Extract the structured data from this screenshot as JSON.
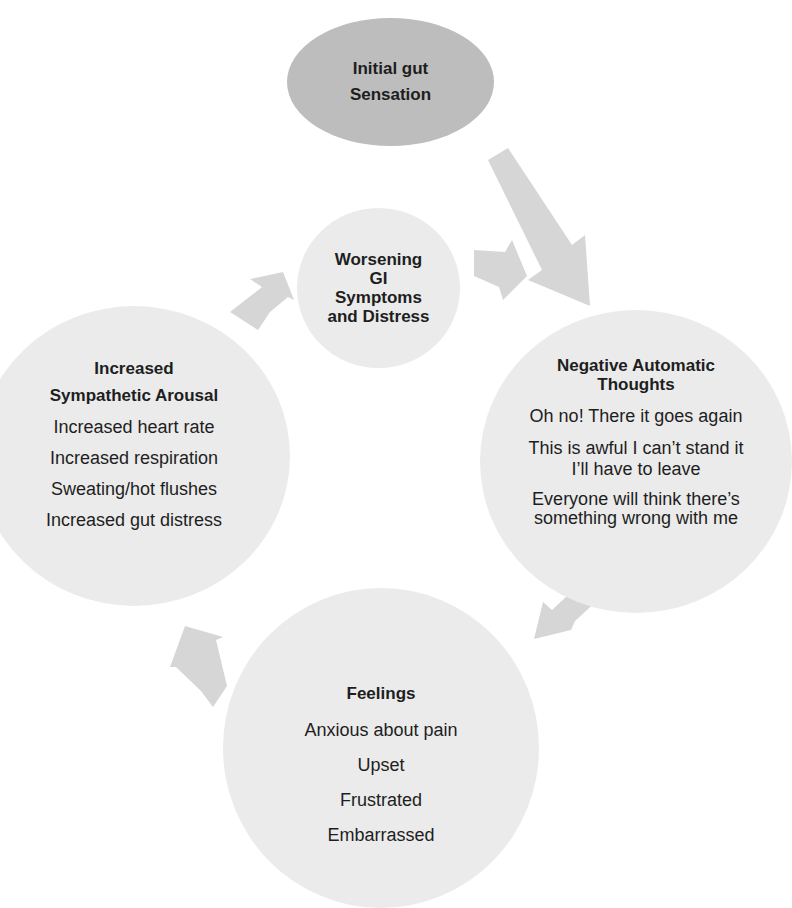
{
  "diagram": {
    "type": "cycle",
    "top_cut_text": "",
    "colors": {
      "start_node": "#bdbdbd",
      "cycle_node": "#ebebeb",
      "arrow": "#d4d4d4",
      "text": "#1e1e1e"
    },
    "start_node": {
      "title_line1": "Initial gut",
      "title_line2": "Sensation"
    },
    "center_node": {
      "lines": [
        "Worsening",
        "GI",
        "Symptoms",
        "and Distress"
      ]
    },
    "thoughts_node": {
      "title_line1": "Negative Automatic",
      "title_line2": "Thoughts",
      "items": [
        "Oh no! There it goes again",
        "This is awful I can’t stand it",
        "I’ll have to leave",
        "Everyone will think there’s",
        "something wrong with me"
      ]
    },
    "feelings_node": {
      "title": "Feelings",
      "items": [
        "Anxious about pain",
        "Upset",
        "Frustrated",
        "Embarrassed"
      ]
    },
    "arousal_node": {
      "title_line1": "Increased",
      "title_line2": "Sympathetic Arousal",
      "items": [
        "Increased heart rate",
        "Increased respiration",
        "Sweating/hot flushes",
        "Increased gut distress"
      ]
    },
    "arrows": [
      {
        "from": "Initial gut Sensation",
        "to": "Negative Automatic Thoughts"
      },
      {
        "from": "Worsening GI Symptoms and Distress",
        "to": "Negative Automatic Thoughts"
      },
      {
        "from": "Negative Automatic Thoughts",
        "to": "Feelings"
      },
      {
        "from": "Feelings",
        "to": "Increased Sympathetic Arousal"
      },
      {
        "from": "Increased Sympathetic Arousal",
        "to": "Worsening GI Symptoms and Distress"
      }
    ]
  }
}
